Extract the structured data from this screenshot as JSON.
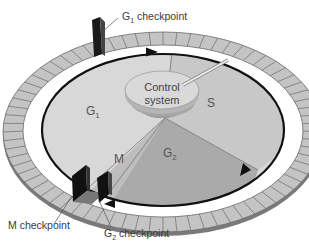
{
  "diagram": {
    "control_system": {
      "line1": "Control",
      "line2": "system"
    },
    "phases": [
      {
        "id": "G1",
        "label": "G",
        "sub": "1",
        "color": "#d8d8d8"
      },
      {
        "id": "S",
        "label": "S",
        "sub": "",
        "color": "#c8c8c8"
      },
      {
        "id": "G2",
        "label": "G",
        "sub": "2",
        "color": "#aaaaaa"
      },
      {
        "id": "M",
        "label": "M",
        "sub": "",
        "color": "#bdbdbd"
      }
    ],
    "checkpoints": [
      {
        "id": "g1-checkpoint",
        "label_main": "G",
        "label_sub": "1",
        "label_rest": " checkpoint"
      },
      {
        "id": "g2-checkpoint",
        "label_main": "G",
        "label_sub": "2",
        "label_rest": " checkpoint"
      },
      {
        "id": "m-checkpoint",
        "label_main": "M checkpoint",
        "label_sub": "",
        "label_rest": ""
      }
    ],
    "colors": {
      "outer_ring": "#c4c4c4",
      "ring_tick": "#6a6a6a",
      "track": "#ffffff",
      "cycle_line": "#111111",
      "gate": "#1a1a1a",
      "control_top": "#d9d9d9",
      "control_side": "#b0b0b0"
    }
  }
}
